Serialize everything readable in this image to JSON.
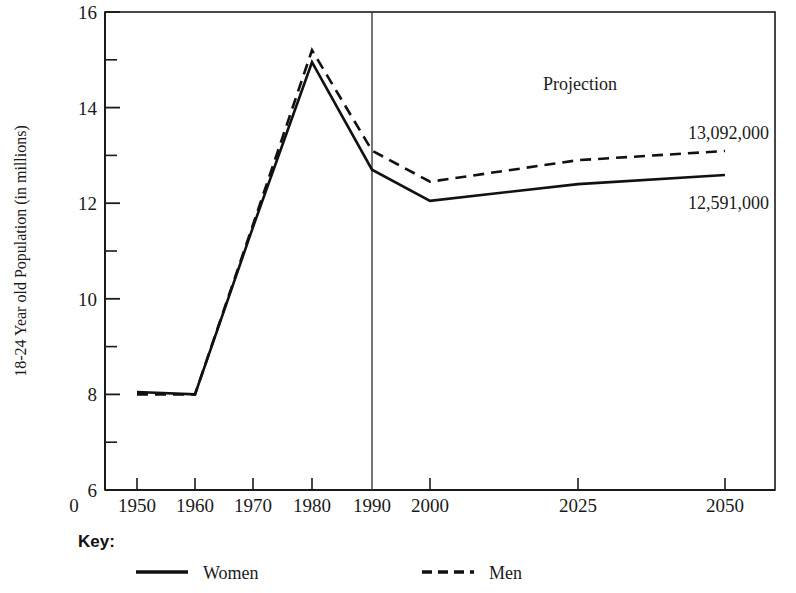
{
  "chart_data": {
    "type": "line",
    "title": "",
    "xlabel": "",
    "ylabel": "18-24 Year old Population (in millions)",
    "x": [
      1950,
      1960,
      1970,
      1980,
      1990,
      2000,
      2025,
      2050
    ],
    "categories": [
      "1950",
      "1960",
      "1970",
      "1980",
      "1990",
      "2000",
      "2025",
      "2050"
    ],
    "xtick_labels": [
      "0",
      "1950",
      "1960",
      "1970",
      "1980",
      "1990",
      "2000",
      "2025",
      "2050"
    ],
    "ytick_labels": [
      "16",
      "14",
      "12",
      "10",
      "8",
      "6"
    ],
    "ytick_values": [
      16,
      14,
      12,
      10,
      8,
      6
    ],
    "yminor_values": [
      15,
      13,
      11,
      9,
      7
    ],
    "ylim": [
      6,
      16
    ],
    "grid": false,
    "legend_position": "below-plot",
    "series": [
      {
        "name": "Women",
        "style": "solid",
        "color": "#111111",
        "values": [
          8.05,
          8.0,
          11.5,
          14.95,
          12.7,
          12.05,
          12.4,
          12.591
        ]
      },
      {
        "name": "Men",
        "style": "dashed",
        "color": "#111111",
        "values": [
          8.0,
          8.0,
          11.55,
          15.2,
          13.1,
          12.45,
          12.9,
          13.092
        ]
      }
    ],
    "annotations": [
      {
        "text": "Projection",
        "x": 2010,
        "y": 15.4
      },
      {
        "text": "13,092,000",
        "series": "Men",
        "x": 2050,
        "y": 13.6
      },
      {
        "text": "12,591,000",
        "series": "Women",
        "x": 2050,
        "y": 12.1
      }
    ],
    "divider": {
      "x": 1990,
      "label": "projection-start"
    }
  },
  "axes": {
    "y_title": "18-24 Year old Population (in millions)",
    "y_labels": [
      "16",
      "14",
      "12",
      "10",
      "8",
      "6"
    ],
    "x_labels": [
      "0",
      "1950",
      "1960",
      "1970",
      "1980",
      "1990",
      "2000",
      "2025",
      "2050"
    ]
  },
  "annotations": {
    "projection": "Projection",
    "men_value": "13,092,000",
    "women_value": "12,591,000"
  },
  "key": {
    "title": "Key:",
    "items": [
      {
        "label": "Women",
        "style": "solid"
      },
      {
        "label": "Men",
        "style": "dashed"
      }
    ]
  },
  "colors": {
    "line": "#111111",
    "axis": "#1a1a1a",
    "background": "#ffffff"
  }
}
